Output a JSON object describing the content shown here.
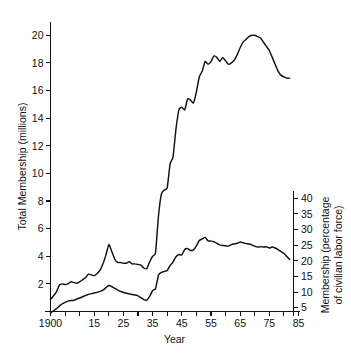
{
  "figure": {
    "top_cut_text": "",
    "background": "#ffffff",
    "line_color": "#111111"
  },
  "chart_data": {
    "type": "line",
    "title": "",
    "xlabel": "Year",
    "ylabel": "Total Membership (millions)",
    "y2label": "Membership (percentage of civilian labor force)",
    "grid": false,
    "legend": "none",
    "xlim": [
      1900,
      1985
    ],
    "ylim": [
      0,
      21
    ],
    "y2lim": [
      0,
      43.5
    ],
    "xticks": [
      1900,
      1905,
      1910,
      1915,
      1920,
      1925,
      1930,
      1935,
      1940,
      1945,
      1950,
      1955,
      1960,
      1965,
      1970,
      1975,
      1980,
      1985
    ],
    "xticklabels": [
      "1900",
      "",
      "",
      "15",
      "",
      "25",
      "",
      "35",
      "",
      "45",
      "",
      "55",
      "",
      "65",
      "",
      "75",
      "",
      "85"
    ],
    "yticks": [
      2,
      4,
      6,
      8,
      10,
      12,
      14,
      16,
      18,
      20
    ],
    "yticklabels": [
      "2",
      "4",
      "6",
      "8",
      "10",
      "12",
      "14",
      "16",
      "18",
      "20"
    ],
    "y2ticks": [
      5,
      10,
      15,
      20,
      25,
      30,
      35,
      40
    ],
    "y2ticklabels": [
      "5",
      "10",
      "15",
      "20",
      "25",
      "30",
      "35",
      "40"
    ],
    "series": [
      {
        "name": "Total Membership (millions)",
        "axis": "left",
        "x": [
          1900,
          1902,
          1903,
          1904,
          1905,
          1906,
          1907,
          1908,
          1909,
          1910,
          1911,
          1912,
          1913,
          1914,
          1915,
          1916,
          1917,
          1918,
          1919,
          1920,
          1921,
          1922,
          1923,
          1924,
          1925,
          1926,
          1927,
          1928,
          1929,
          1930,
          1931,
          1932,
          1933,
          1934,
          1935,
          1936,
          1937,
          1938,
          1939,
          1940,
          1941,
          1942,
          1943,
          1944,
          1945,
          1946,
          1947,
          1948,
          1949,
          1950,
          1951,
          1952,
          1953,
          1954,
          1955,
          1956,
          1957,
          1958,
          1959,
          1960,
          1961,
          1962,
          1963,
          1964,
          1965,
          1966,
          1967,
          1968,
          1969,
          1970,
          1971,
          1972,
          1973,
          1974,
          1975,
          1976,
          1977,
          1978,
          1979,
          1980,
          1981,
          1982
        ],
        "values": [
          0.87,
          1.4,
          1.9,
          2.0,
          1.95,
          2.0,
          2.15,
          2.1,
          2.05,
          2.15,
          2.3,
          2.45,
          2.7,
          2.65,
          2.6,
          2.75,
          3.0,
          3.45,
          4.1,
          4.85,
          4.35,
          3.8,
          3.55,
          3.55,
          3.5,
          3.5,
          3.6,
          3.45,
          3.45,
          3.4,
          3.35,
          3.15,
          3.1,
          3.6,
          4.0,
          4.25,
          6.9,
          8.5,
          8.8,
          8.95,
          10.7,
          11.2,
          13.2,
          14.6,
          14.8,
          14.6,
          15.4,
          15.3,
          15.1,
          15.9,
          17.0,
          17.4,
          18.1,
          17.9,
          18.1,
          18.5,
          18.4,
          18.1,
          18.4,
          18.15,
          17.9,
          18.0,
          18.2,
          18.6,
          19.1,
          19.5,
          19.7,
          19.9,
          20.0,
          20.0,
          19.9,
          19.8,
          19.5,
          19.2,
          18.9,
          18.4,
          17.9,
          17.4,
          17.1,
          17.0,
          16.9,
          16.9
        ],
        "last_value": 16.9,
        "peak_value": 20.0,
        "peak_year": 1970
      },
      {
        "name": "Membership (percentage of civilian labor force)",
        "axis": "right",
        "x": [
          1900,
          1902,
          1904,
          1906,
          1908,
          1910,
          1912,
          1914,
          1916,
          1918,
          1920,
          1922,
          1924,
          1926,
          1928,
          1930,
          1932,
          1933,
          1934,
          1935,
          1936,
          1937,
          1938,
          1939,
          1940,
          1941,
          1942,
          1943,
          1944,
          1945,
          1946,
          1947,
          1948,
          1949,
          1950,
          1951,
          1952,
          1953,
          1954,
          1955,
          1956,
          1957,
          1958,
          1959,
          1960,
          1961,
          1962,
          1963,
          1964,
          1965,
          1966,
          1967,
          1968,
          1969,
          1970,
          1971,
          1972,
          1973,
          1974,
          1975,
          1976,
          1977,
          1978,
          1979,
          1980,
          1981,
          1982
        ],
        "values": [
          3.3,
          4.7,
          6.2,
          7.1,
          7.4,
          8.1,
          8.9,
          9.5,
          9.9,
          10.6,
          12.1,
          11.2,
          10.2,
          9.6,
          9.2,
          8.8,
          7.6,
          7.4,
          8.6,
          10.5,
          11.1,
          15.4,
          16.3,
          16.6,
          16.9,
          18.5,
          19.6,
          21.3,
          22.0,
          21.9,
          23.6,
          23.9,
          23.3,
          23.5,
          24.8,
          26.5,
          27.0,
          27.5,
          26.4,
          26.3,
          26.1,
          25.6,
          25.1,
          24.9,
          24.8,
          24.7,
          25.2,
          25.4,
          25.6,
          26.0,
          25.8,
          25.5,
          25.4,
          25.1,
          24.7,
          24.4,
          24.5,
          24.4,
          24.5,
          24.1,
          24.4,
          24.1,
          23.6,
          23.0,
          22.4,
          21.4,
          20.4
        ],
        "last_value": 20.4,
        "peak_value": 27.5,
        "peak_year": 1953
      }
    ]
  }
}
